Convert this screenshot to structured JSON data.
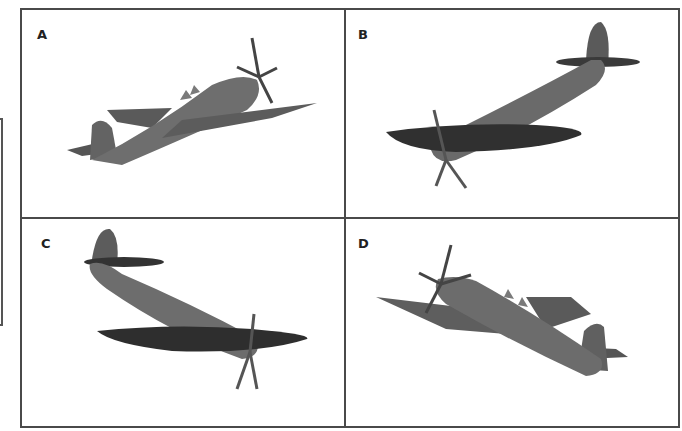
{
  "figure": {
    "panels": [
      {
        "label": "A",
        "description": "aircraft model, nose up-right, underside of left wing visible"
      },
      {
        "label": "B",
        "description": "aircraft model, nose down-left, dark underside of wings"
      },
      {
        "label": "C",
        "description": "aircraft model, nose down-right, dark underside of wings"
      },
      {
        "label": "D",
        "description": "aircraft model, nose up-left, tail down-right"
      }
    ],
    "colors": {
      "border": "#4a4a4a",
      "fuselage": "#6e6e6e",
      "wing_dark": "#333333",
      "wing_mid": "#595959"
    }
  }
}
